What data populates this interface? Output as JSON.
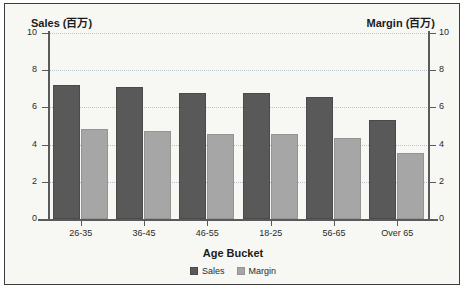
{
  "chart_data": {
    "type": "bar",
    "title": "",
    "categories": [
      "26-35",
      "36-45",
      "46-55",
      "18-25",
      "56-65",
      "Over 65"
    ],
    "series": [
      {
        "name": "Sales",
        "values": [
          7.2,
          7.1,
          6.8,
          6.75,
          6.55,
          5.3
        ]
      },
      {
        "name": "Margin",
        "values": [
          4.85,
          4.75,
          4.55,
          4.55,
          4.35,
          3.55
        ]
      }
    ],
    "xlabel": "Age Bucket",
    "ylabel": "Sales (百万)",
    "y2label": "Margin (百万)",
    "ylim": [
      0,
      10
    ],
    "y2lim": [
      0,
      10
    ],
    "yticks": [
      "10",
      "8",
      "6",
      "4",
      "2",
      "0"
    ],
    "y2ticks": [
      "10",
      "8",
      "6",
      "4",
      "2",
      "0"
    ],
    "grid": true,
    "legend_position": "bottom",
    "colors": {
      "sales": "#595959",
      "margin": "#a6a6a6",
      "grid": "#b9c3cf",
      "axis": "#5a5a5a",
      "background": "#f7f7f4",
      "border": "#3c3c3c"
    }
  },
  "legend": {
    "items": [
      {
        "label": "Sales"
      },
      {
        "label": "Margin"
      }
    ]
  }
}
